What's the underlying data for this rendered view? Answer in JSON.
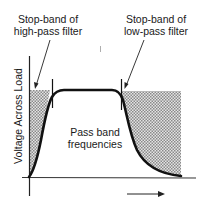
{
  "diagram": {
    "title": "",
    "annotations": {
      "left_stopband": {
        "line1": "Stop-band of",
        "line2": "high-pass filter"
      },
      "right_stopband": {
        "line1": "Stop-band of",
        "line2": "low-pass filter"
      },
      "passband": {
        "line1": "Pass band",
        "line2": "frequencies"
      }
    },
    "axes": {
      "y_label": "Voltage Across Load",
      "x_label": "",
      "x_direction_arrow": "increasing-frequency-arrow"
    },
    "colors": {
      "curve": "#111111",
      "axis": "#222222",
      "shade": "#b8b8b8",
      "background": "#ffffff"
    }
  }
}
